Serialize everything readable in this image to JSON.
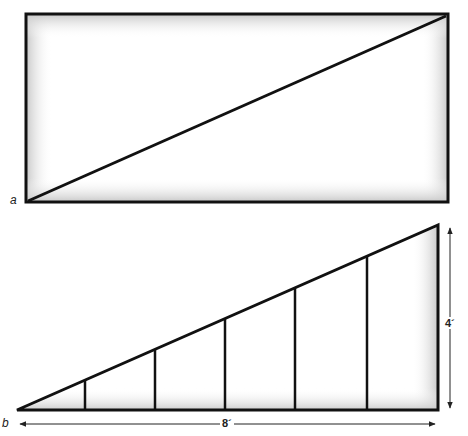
{
  "figure": {
    "panel_a": {
      "label": "a",
      "shape": "rectangle-with-diagonal"
    },
    "panel_b": {
      "label": "b",
      "shape": "right-triangle-with-vertical-supports",
      "vertical_supports": 5,
      "width_label": "8´",
      "height_label": "4´"
    }
  },
  "colors": {
    "stroke": "#111111",
    "shade": "#c8c8c8",
    "background": "#ffffff"
  }
}
